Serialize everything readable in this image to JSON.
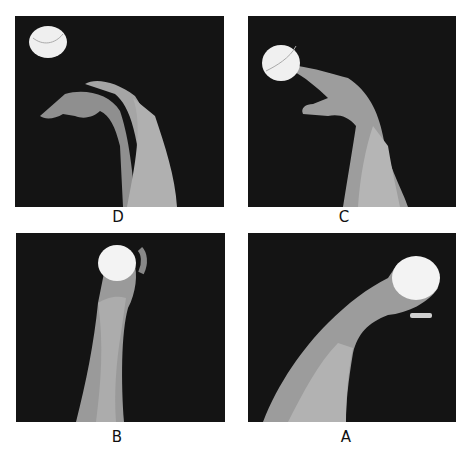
{
  "figure": {
    "panels": [
      {
        "id": "D",
        "label": "D",
        "description": "Wrist flexed down after release; ball in flight at upper left"
      },
      {
        "id": "C",
        "label": "C",
        "description": "Ball leaving fingertips; wrist flexing forward"
      },
      {
        "id": "B",
        "label": "B",
        "description": "Ball held upright in hand; forearm vertical"
      },
      {
        "id": "A",
        "label": "A",
        "description": "Ball cradled in hand with wrist cocked back; forearm angled"
      }
    ],
    "colors": {
      "background": "#ffffff",
      "photo_bg": "#141414",
      "skin": "#9a9a9a",
      "ball": "#f2f2f2",
      "label": "#111111"
    }
  }
}
